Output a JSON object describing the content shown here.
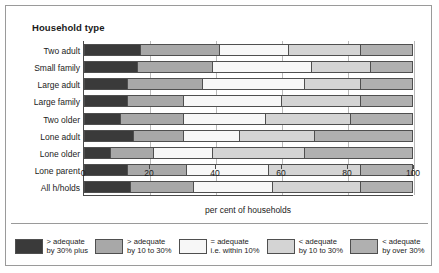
{
  "chart_data": {
    "type": "bar",
    "orientation": "horizontal",
    "stacked": true,
    "stacked_percent": true,
    "title": "Household type",
    "xlabel": "per cent  of households",
    "ylabel": "",
    "xlim": [
      0,
      100
    ],
    "xticks": [
      0,
      20,
      40,
      60,
      80,
      100
    ],
    "grid": true,
    "legend_position": "bottom",
    "categories": [
      "Two adult",
      "Small family",
      "Large adult",
      "Large family",
      "Two older",
      "Lone adult",
      "Lone older",
      "Lone parent",
      "All h/holds"
    ],
    "series": [
      {
        "name": "> adequate by 30% plus",
        "color": "#3a3a3a",
        "values": [
          17,
          16,
          13,
          13,
          11,
          15,
          8,
          13,
          14
        ]
      },
      {
        "name": "> adequate by 10 to 30%",
        "color": "#a8a8a8",
        "values": [
          24,
          23,
          23,
          17,
          19,
          15,
          13,
          18,
          19
        ]
      },
      {
        "name": "= adequate i.e. within 10%",
        "color": "#f7f7f7",
        "values": [
          21,
          30,
          31,
          30,
          25,
          17,
          18,
          25,
          24
        ]
      },
      {
        "name": "< adequate by 10 to 30%",
        "color": "#d4d4d4",
        "values": [
          22,
          18,
          17,
          24,
          26,
          23,
          28,
          28,
          27
        ]
      },
      {
        "name": "< adequate by over 30%",
        "color": "#b0b0b0",
        "values": [
          16,
          13,
          16,
          16,
          19,
          30,
          33,
          16,
          16
        ]
      }
    ],
    "legend": [
      {
        "line1": "> adequate",
        "line2": "by 30% plus",
        "color": "#3a3a3a"
      },
      {
        "line1": "> adequate",
        "line2": "by 10 to 30%",
        "color": "#a8a8a8"
      },
      {
        "line1": "= adequate",
        "line2": "i.e. within 10%",
        "color": "#f7f7f7"
      },
      {
        "line1": "< adequate",
        "line2": "by 10 to 30%",
        "color": "#d4d4d4"
      },
      {
        "line1": "< adequate",
        "line2": "by over 30%",
        "color": "#b0b0b0"
      }
    ]
  }
}
